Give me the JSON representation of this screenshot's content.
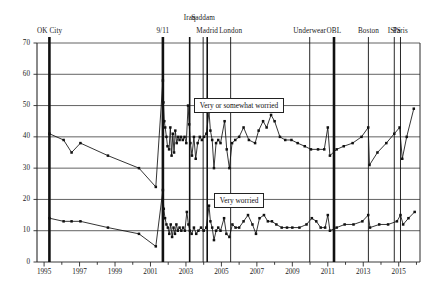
{
  "chart_data": {
    "type": "line",
    "title": "",
    "xlabel": "",
    "ylabel": "",
    "xlim": [
      1994.6,
      2016.2
    ],
    "ylim": [
      0,
      70
    ],
    "yticks": [
      0,
      10,
      20,
      30,
      40,
      50,
      60,
      70
    ],
    "xticks": [
      1995,
      1997,
      1999,
      2001,
      2003,
      2005,
      2007,
      2009,
      2011,
      2013,
      2015
    ],
    "xtick_labels": [
      "1995",
      "1997",
      "1999",
      "2001",
      "2003",
      "2005",
      "2007",
      "2009",
      "2011",
      "2013",
      "2015"
    ],
    "ytick_labels": [
      "0",
      "10",
      "20",
      "30",
      "40",
      "50",
      "60",
      "70"
    ],
    "grid": true,
    "grid_axis": "y",
    "legend_position": "inline-annotation",
    "marker": "filled-square",
    "line_color": "#111111",
    "series": [
      {
        "name": "Very or somewhat worried",
        "label_x": 2006.0,
        "label_y": 50.0,
        "points": [
          [
            1995.3,
            41.0
          ],
          [
            1996.1,
            39.0
          ],
          [
            1996.55,
            35.0
          ],
          [
            1997.05,
            38.0
          ],
          [
            1998.6,
            34.0
          ],
          [
            2000.35,
            30.0
          ],
          [
            2001.3,
            24.0
          ],
          [
            2001.7,
            58.0
          ],
          [
            2001.73,
            51.0
          ],
          [
            2001.78,
            45.0
          ],
          [
            2001.83,
            43.0
          ],
          [
            2001.9,
            40.0
          ],
          [
            2001.96,
            37.0
          ],
          [
            2002.05,
            36.0
          ],
          [
            2002.12,
            43.0
          ],
          [
            2002.19,
            34.0
          ],
          [
            2002.26,
            41.0
          ],
          [
            2002.33,
            35.0
          ],
          [
            2002.4,
            42.0
          ],
          [
            2002.48,
            38.0
          ],
          [
            2002.56,
            40.0
          ],
          [
            2002.64,
            39.0
          ],
          [
            2002.72,
            40.0
          ],
          [
            2002.82,
            39.0
          ],
          [
            2002.92,
            40.0
          ],
          [
            2003.02,
            38.0
          ],
          [
            2003.12,
            50.0
          ],
          [
            2003.18,
            44.0
          ],
          [
            2003.25,
            38.0
          ],
          [
            2003.34,
            34.0
          ],
          [
            2003.45,
            40.0
          ],
          [
            2003.55,
            33.0
          ],
          [
            2003.66,
            38.0
          ],
          [
            2003.78,
            40.0
          ],
          [
            2003.9,
            39.0
          ],
          [
            2004.02,
            40.0
          ],
          [
            2004.15,
            41.0
          ],
          [
            2004.3,
            48.0
          ],
          [
            2004.38,
            42.0
          ],
          [
            2004.48,
            39.0
          ],
          [
            2004.58,
            30.0
          ],
          [
            2004.7,
            38.0
          ],
          [
            2004.82,
            39.0
          ],
          [
            2004.95,
            38.0
          ],
          [
            2005.18,
            45.0
          ],
          [
            2005.3,
            36.0
          ],
          [
            2005.45,
            30.0
          ],
          [
            2005.6,
            38.0
          ],
          [
            2005.78,
            39.0
          ],
          [
            2006.0,
            40.0
          ],
          [
            2006.25,
            43.0
          ],
          [
            2006.55,
            39.0
          ],
          [
            2006.9,
            38.0
          ],
          [
            2007.1,
            42.0
          ],
          [
            2007.35,
            45.0
          ],
          [
            2007.55,
            43.0
          ],
          [
            2007.8,
            47.0
          ],
          [
            2008.0,
            45.0
          ],
          [
            2008.3,
            40.0
          ],
          [
            2008.6,
            39.0
          ],
          [
            2008.95,
            39.0
          ],
          [
            2009.3,
            38.0
          ],
          [
            2009.7,
            37.0
          ],
          [
            2010.05,
            36.0
          ],
          [
            2010.45,
            36.0
          ],
          [
            2010.8,
            36.0
          ],
          [
            2011.0,
            43.0
          ],
          [
            2011.12,
            34.0
          ],
          [
            2011.5,
            36.0
          ],
          [
            2011.9,
            37.0
          ],
          [
            2012.4,
            38.0
          ],
          [
            2012.9,
            40.0
          ],
          [
            2013.28,
            43.0
          ],
          [
            2013.35,
            31.0
          ],
          [
            2013.8,
            35.0
          ],
          [
            2014.3,
            38.0
          ],
          [
            2014.75,
            41.0
          ],
          [
            2015.05,
            43.0
          ],
          [
            2015.2,
            33.0
          ],
          [
            2015.45,
            40.0
          ],
          [
            2015.85,
            49.0
          ]
        ]
      },
      {
        "name": "Very worried",
        "label_x": 2006.0,
        "label_y": 19.5,
        "points": [
          [
            1995.3,
            14.0
          ],
          [
            1996.1,
            13.0
          ],
          [
            1996.55,
            13.0
          ],
          [
            1997.05,
            13.0
          ],
          [
            1998.6,
            11.0
          ],
          [
            2000.35,
            9.0
          ],
          [
            2001.3,
            5.0
          ],
          [
            2001.7,
            23.0
          ],
          [
            2001.75,
            17.0
          ],
          [
            2001.82,
            14.0
          ],
          [
            2001.9,
            12.0
          ],
          [
            2001.98,
            11.0
          ],
          [
            2002.06,
            9.0
          ],
          [
            2002.14,
            12.0
          ],
          [
            2002.22,
            8.0
          ],
          [
            2002.3,
            11.0
          ],
          [
            2002.38,
            9.0
          ],
          [
            2002.46,
            12.0
          ],
          [
            2002.54,
            10.0
          ],
          [
            2002.64,
            11.0
          ],
          [
            2002.74,
            10.0
          ],
          [
            2002.84,
            11.0
          ],
          [
            2002.94,
            10.0
          ],
          [
            2003.05,
            16.0
          ],
          [
            2003.14,
            12.0
          ],
          [
            2003.22,
            10.0
          ],
          [
            2003.32,
            9.0
          ],
          [
            2003.45,
            11.0
          ],
          [
            2003.58,
            9.0
          ],
          [
            2003.7,
            10.0
          ],
          [
            2003.85,
            11.0
          ],
          [
            2004.0,
            10.0
          ],
          [
            2004.15,
            11.0
          ],
          [
            2004.3,
            18.0
          ],
          [
            2004.38,
            13.0
          ],
          [
            2004.48,
            11.0
          ],
          [
            2004.58,
            7.0
          ],
          [
            2004.7,
            10.0
          ],
          [
            2004.82,
            11.0
          ],
          [
            2004.95,
            10.0
          ],
          [
            2005.15,
            14.0
          ],
          [
            2005.28,
            9.0
          ],
          [
            2005.45,
            8.0
          ],
          [
            2005.62,
            12.0
          ],
          [
            2005.8,
            11.0
          ],
          [
            2006.0,
            11.0
          ],
          [
            2006.25,
            13.0
          ],
          [
            2006.5,
            15.0
          ],
          [
            2006.75,
            12.0
          ],
          [
            2006.95,
            9.0
          ],
          [
            2007.15,
            14.0
          ],
          [
            2007.4,
            15.0
          ],
          [
            2007.62,
            13.0
          ],
          [
            2007.85,
            13.0
          ],
          [
            2008.1,
            12.0
          ],
          [
            2008.4,
            11.0
          ],
          [
            2008.7,
            11.0
          ],
          [
            2009.0,
            11.0
          ],
          [
            2009.4,
            11.0
          ],
          [
            2009.8,
            12.0
          ],
          [
            2010.1,
            14.0
          ],
          [
            2010.35,
            13.0
          ],
          [
            2010.6,
            11.0
          ],
          [
            2010.85,
            11.0
          ],
          [
            2011.0,
            15.0
          ],
          [
            2011.12,
            10.0
          ],
          [
            2011.5,
            11.0
          ],
          [
            2011.95,
            12.0
          ],
          [
            2012.45,
            12.0
          ],
          [
            2012.95,
            13.0
          ],
          [
            2013.28,
            15.0
          ],
          [
            2013.38,
            11.0
          ],
          [
            2013.9,
            12.0
          ],
          [
            2014.4,
            12.0
          ],
          [
            2014.9,
            13.0
          ],
          [
            2015.1,
            15.0
          ],
          [
            2015.25,
            12.0
          ],
          [
            2015.55,
            14.0
          ],
          [
            2015.9,
            16.0
          ]
        ]
      }
    ],
    "events": [
      {
        "label": "OK City",
        "x": 1995.3,
        "weight": "thick",
        "label_row": 1,
        "label_align": "center"
      },
      {
        "label": "9/11",
        "x": 2001.7,
        "weight": "thick",
        "label_row": 1,
        "label_align": "center"
      },
      {
        "label": "Iraq",
        "x": 2003.21,
        "weight": "medium",
        "label_row": 0,
        "label_align": "center"
      },
      {
        "label": "Saddam",
        "x": 2003.97,
        "weight": "thin",
        "label_row": 0,
        "label_align": "center"
      },
      {
        "label": "Madrid",
        "x": 2004.2,
        "weight": "medium",
        "label_row": 1,
        "label_align": "center"
      },
      {
        "label": "London",
        "x": 2005.52,
        "weight": "thin",
        "label_row": 1,
        "label_align": "center"
      },
      {
        "label": "Underwear",
        "x": 2009.98,
        "weight": "thin",
        "label_row": 1,
        "label_align": "center"
      },
      {
        "label": "OBL",
        "x": 2011.35,
        "weight": "thick",
        "label_row": 1,
        "label_align": "center"
      },
      {
        "label": "Boston",
        "x": 2013.29,
        "weight": "thin",
        "label_row": 1,
        "label_align": "center"
      },
      {
        "label": "ISIS",
        "x": 2014.75,
        "weight": "thin",
        "label_row": 1,
        "label_align": "center"
      },
      {
        "label": "Paris",
        "x": 2015.1,
        "weight": "thin",
        "label_row": 1,
        "label_align": "center"
      }
    ]
  }
}
